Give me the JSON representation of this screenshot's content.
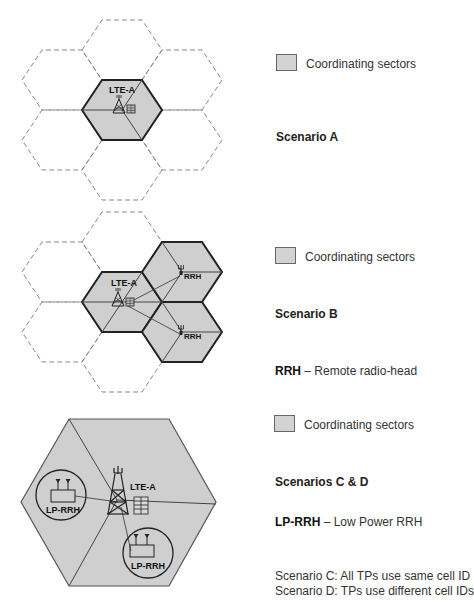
{
  "colors": {
    "sector_fill": "#cfcfcf",
    "line": "#222222",
    "dashed": "#888888",
    "background": "#ffffff"
  },
  "scenario_a": {
    "station_label": "LTE-A",
    "legend_label": "Coordinating sectors",
    "title": "Scenario A"
  },
  "scenario_b": {
    "station_label": "LTE-A",
    "rrh_labels": [
      "RRH",
      "RRH"
    ],
    "legend_label": "Coordinating sectors",
    "title": "Scenario B",
    "abbr_term": "RRH",
    "abbr_def": " – Remote radio-head"
  },
  "scenario_cd": {
    "station_label": "LTE-A",
    "lprrh_labels": [
      "LP-RRH",
      "LP-RRH"
    ],
    "legend_label": "Coordinating sectors",
    "title": "Scenarios C & D",
    "abbr_term": "LP-RRH",
    "abbr_def": " – Low Power RRH",
    "notes": [
      "Scenario C: All TPs use same cell ID",
      "Scenario D: TPs use different cell IDs"
    ]
  }
}
